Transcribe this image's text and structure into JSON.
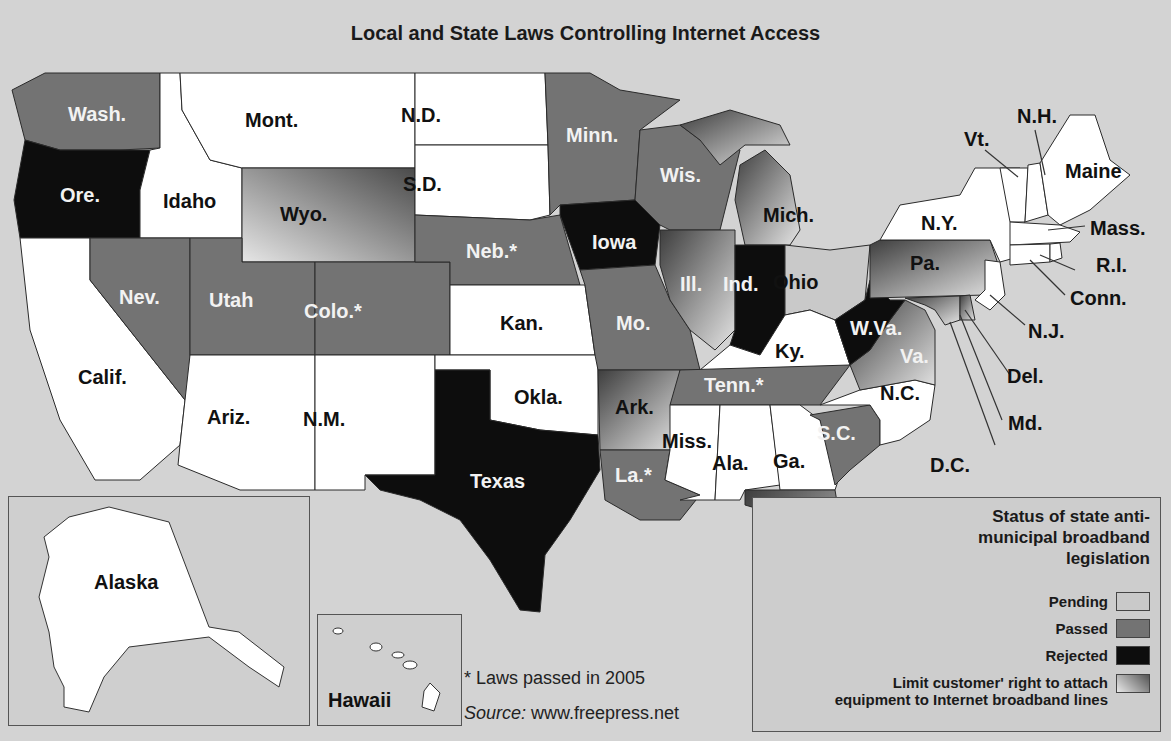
{
  "title": "Local and State Laws Controlling Internet Access",
  "colors": {
    "background": "#d3d3d3",
    "pending": "#c9c9c9",
    "passed": "#737373",
    "rejected": "#0d0d0d",
    "limit_gradient_start": "#e8e8e8",
    "limit_gradient_end": "#555555",
    "no_legislation": "#ffffff"
  },
  "states": [
    {
      "abbr": "Wash.",
      "status": "passed"
    },
    {
      "abbr": "Ore.",
      "status": "rejected"
    },
    {
      "abbr": "Calif.",
      "status": "none"
    },
    {
      "abbr": "Idaho",
      "status": "none"
    },
    {
      "abbr": "Mont.",
      "status": "none"
    },
    {
      "abbr": "Wyo.",
      "status": "limit"
    },
    {
      "abbr": "Nev.",
      "status": "passed"
    },
    {
      "abbr": "Utah",
      "status": "passed"
    },
    {
      "abbr": "Colo.*",
      "status": "passed"
    },
    {
      "abbr": "Ariz.",
      "status": "none"
    },
    {
      "abbr": "N.M.",
      "status": "none"
    },
    {
      "abbr": "N.D.",
      "status": "none"
    },
    {
      "abbr": "S.D.",
      "status": "none"
    },
    {
      "abbr": "Neb.*",
      "status": "passed"
    },
    {
      "abbr": "Kan.",
      "status": "none"
    },
    {
      "abbr": "Okla.",
      "status": "none"
    },
    {
      "abbr": "Texas",
      "status": "rejected"
    },
    {
      "abbr": "Minn.",
      "status": "passed"
    },
    {
      "abbr": "Iowa",
      "status": "rejected"
    },
    {
      "abbr": "Mo.",
      "status": "passed"
    },
    {
      "abbr": "Ark.",
      "status": "limit"
    },
    {
      "abbr": "La.*",
      "status": "passed"
    },
    {
      "abbr": "Wis.",
      "status": "passed"
    },
    {
      "abbr": "Ill.",
      "status": "limit"
    },
    {
      "abbr": "Mich.",
      "status": "limit"
    },
    {
      "abbr": "Ind.",
      "status": "rejected"
    },
    {
      "abbr": "Ohio",
      "status": "pending"
    },
    {
      "abbr": "Ky.",
      "status": "none"
    },
    {
      "abbr": "Tenn.*",
      "status": "passed"
    },
    {
      "abbr": "Miss.",
      "status": "none"
    },
    {
      "abbr": "Ala.",
      "status": "none"
    },
    {
      "abbr": "Ga.",
      "status": "none"
    },
    {
      "abbr": "Fla.*",
      "status": "limit"
    },
    {
      "abbr": "S.C.",
      "status": "passed"
    },
    {
      "abbr": "N.C.",
      "status": "none"
    },
    {
      "abbr": "Va.",
      "status": "limit"
    },
    {
      "abbr": "W.Va.",
      "status": "rejected"
    },
    {
      "abbr": "Pa.",
      "status": "limit"
    },
    {
      "abbr": "N.Y.",
      "status": "none"
    },
    {
      "abbr": "Vt.",
      "status": "none"
    },
    {
      "abbr": "N.H.",
      "status": "none"
    },
    {
      "abbr": "Maine",
      "status": "none"
    },
    {
      "abbr": "Mass.",
      "status": "none"
    },
    {
      "abbr": "R.I.",
      "status": "none"
    },
    {
      "abbr": "Conn.",
      "status": "none"
    },
    {
      "abbr": "N.J.",
      "status": "none"
    },
    {
      "abbr": "Del.",
      "status": "limit"
    },
    {
      "abbr": "Md.",
      "status": "limit"
    },
    {
      "abbr": "D.C.",
      "status": "limit"
    },
    {
      "abbr": "Alaska",
      "status": "none"
    },
    {
      "abbr": "Hawaii",
      "status": "none"
    }
  ],
  "legend": {
    "title_lines": [
      "Status of state anti-",
      "municipal broadband",
      "legislation"
    ],
    "items": [
      {
        "label": "Pending",
        "key": "pending"
      },
      {
        "label": "Passed",
        "key": "passed"
      },
      {
        "label": "Rejected",
        "key": "rejected"
      },
      {
        "label_lines": [
          "Limit customer' right to attach",
          "equipment to Internet broadband lines"
        ],
        "key": "limit"
      }
    ]
  },
  "footnote": "* Laws passed in 2005",
  "source_label": "Source:",
  "source_value": "www.freepress.net"
}
